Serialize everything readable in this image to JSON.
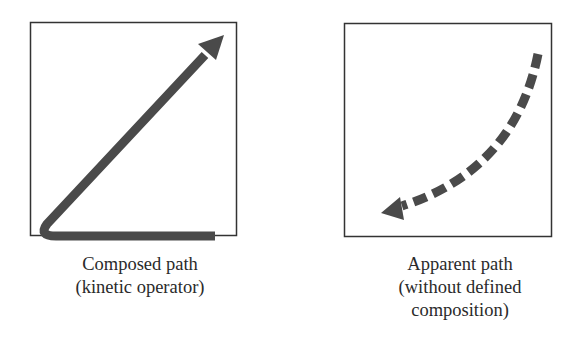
{
  "panels": [
    {
      "id": "left",
      "caption": [
        "Composed path",
        "(kinetic operator)"
      ],
      "path_style": "solid",
      "description": "Arrow runs along the bottom edge, bends at bottom-left corner, then goes diagonally to the upper-right"
    },
    {
      "id": "right",
      "caption": [
        "Apparent path",
        "(without defined",
        "composition)"
      ],
      "path_style": "dashed",
      "description": "Curved dashed arrow from upper-right sweeping down to lower-left"
    }
  ],
  "colors": {
    "frame": "#333333",
    "arrow": "#4a4a4a",
    "text": "#2a2a2a",
    "background": "#ffffff"
  }
}
